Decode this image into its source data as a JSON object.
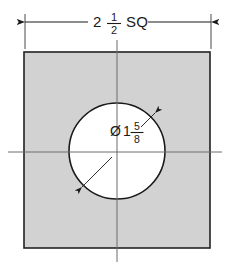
{
  "drawing": {
    "title": "Square plate with centered through hole",
    "background_color": "#ffffff",
    "line_color": "#1a1a1a",
    "plate": {
      "name": "square-plate",
      "fill_color": "#d2d2d2",
      "stroke_color": "#222222",
      "x": 24,
      "y": 52,
      "width": 186,
      "height": 196
    },
    "hole": {
      "name": "circular-hole",
      "fill_color": "#ffffff",
      "stroke_color": "#1a1a1a",
      "center_x": 117,
      "center_y": 151,
      "radius": 48
    },
    "centerlines": {
      "color": "#6d6d6d",
      "horizontal_y": 152,
      "vertical_x": 117
    },
    "width_dimension": {
      "name": "overall-width-dimension",
      "whole": "2",
      "numerator": "1",
      "denominator": "2",
      "suffix": "SQ",
      "full_text": "2 1/2 SQ",
      "line_y": 22,
      "left_x": 25,
      "right_x": 211
    },
    "diameter_dimension": {
      "name": "hole-diameter-dimension",
      "symbol": "Ø",
      "whole": "1",
      "numerator": "5",
      "denominator": "8",
      "full_text": "Ø1 5/8",
      "arrow_start_x": 82,
      "arrow_start_y": 187,
      "arrow_end_x": 155,
      "arrow_end_y": 113
    }
  }
}
